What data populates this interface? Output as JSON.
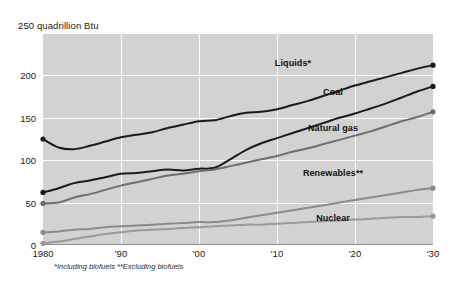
{
  "chart_data": {
    "type": "line",
    "title": "250 quadrillion Btu",
    "xlabel": "",
    "ylabel": "quadrillion Btu",
    "xlim": [
      1980,
      2030
    ],
    "ylim": [
      0,
      250
    ],
    "grid": true,
    "legend_position": "inline-labels",
    "x_ticks": [
      "1980",
      "'90",
      "'00",
      "'10",
      "'20",
      "'30"
    ],
    "x_tick_values": [
      1980,
      1990,
      2000,
      2010,
      2020,
      2030
    ],
    "y_ticks": [
      "0",
      "50",
      "100",
      "150",
      "200",
      "250"
    ],
    "y_tick_values": [
      0,
      50,
      100,
      150,
      200,
      250
    ],
    "x": [
      1980,
      1982,
      1984,
      1986,
      1988,
      1990,
      1992,
      1994,
      1996,
      1998,
      2000,
      2002,
      2004,
      2006,
      2008,
      2010,
      2012,
      2014,
      2016,
      2018,
      2020,
      2022,
      2024,
      2026,
      2028,
      2030
    ],
    "series": [
      {
        "name": "Liquids*",
        "color": "#1a1a1a",
        "values": [
          125,
          115,
          113,
          117,
          122,
          127,
          130,
          133,
          138,
          142,
          146,
          147,
          152,
          156,
          157,
          160,
          165,
          170,
          176,
          182,
          188,
          193,
          198,
          203,
          208,
          212
        ]
      },
      {
        "name": "Coal",
        "color": "#1a1a1a",
        "values": [
          62,
          67,
          73,
          76,
          80,
          84,
          85,
          87,
          89,
          88,
          90,
          91,
          101,
          112,
          120,
          126,
          132,
          138,
          144,
          150,
          155,
          161,
          167,
          174,
          181,
          187
        ]
      },
      {
        "name": "Natural gas",
        "color": "#6e6e6e",
        "values": [
          49,
          50,
          56,
          60,
          65,
          70,
          74,
          78,
          82,
          84,
          87,
          89,
          93,
          97,
          101,
          105,
          110,
          114,
          119,
          124,
          129,
          134,
          140,
          146,
          151,
          157
        ]
      },
      {
        "name": "Renewables**",
        "color": "#8a8a8a",
        "values": [
          15,
          16,
          18,
          19,
          21,
          22,
          23,
          24,
          25,
          26,
          27,
          27,
          29,
          32,
          35,
          38,
          41,
          44,
          47,
          50,
          53,
          56,
          59,
          62,
          65,
          67
        ]
      },
      {
        "name": "Nuclear",
        "color": "#9a9a9a",
        "values": [
          2,
          4,
          7,
          10,
          13,
          15,
          17,
          18,
          19,
          20,
          21,
          22,
          23,
          24,
          24,
          25,
          26,
          27,
          28,
          29,
          30,
          31,
          32,
          33,
          33,
          34
        ]
      }
    ],
    "series_label_positions": [
      {
        "name": "Liquids*",
        "x": 293,
        "y": 63
      },
      {
        "name": "Coal",
        "x": 333,
        "y": 92
      },
      {
        "name": "Natural gas",
        "x": 333,
        "y": 128
      },
      {
        "name": "Renewables**",
        "x": 333,
        "y": 173
      },
      {
        "name": "Nuclear",
        "x": 333,
        "y": 218
      }
    ],
    "endpoint_markers": true,
    "footnote": "*Including biofuels **Excluding biofuels",
    "colors": {
      "plot_background": "#d2d2d2",
      "gridline": "#ffffff",
      "page_background": "#ffffff",
      "text": "#1a1a1a"
    }
  }
}
